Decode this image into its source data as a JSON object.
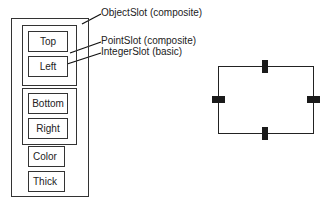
{
  "diagram": {
    "object_slot": {
      "label": "ObjectSlot (composite)",
      "groups": [
        {
          "name": "point-slot-1",
          "slots": [
            "Top",
            "Left"
          ]
        },
        {
          "name": "point-slot-2",
          "slots": [
            "Bottom",
            "Right"
          ]
        }
      ],
      "basic_slots": [
        "Color",
        "Thick"
      ]
    },
    "annotations": {
      "object_slot": "ObjectSlot (composite)",
      "point_slot": "PointSlot (composite)",
      "integer_slot": "IntegerSlot (basic)"
    },
    "shape": {
      "type": "rectangle",
      "handles": [
        "top",
        "left",
        "right",
        "bottom"
      ]
    }
  }
}
